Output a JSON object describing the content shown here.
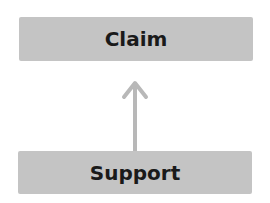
{
  "diagram": {
    "nodes": [
      {
        "id": "claim",
        "label": "Claim"
      },
      {
        "id": "support",
        "label": "Support"
      }
    ],
    "edges": [
      {
        "from": "support",
        "to": "claim",
        "style": "open-arrow"
      }
    ],
    "colors": {
      "box_fill": "#c4c4c4",
      "arrow": "#b8b8b8",
      "text": "#1a1a1a"
    }
  }
}
